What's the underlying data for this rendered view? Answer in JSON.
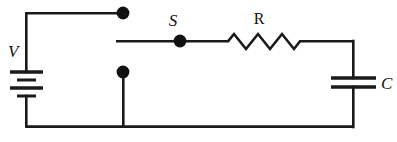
{
  "figure": {
    "background_color": "#ffffff",
    "line_color": "#1a1a1a",
    "width": 397,
    "height": 142
  },
  "components": {
    "battery": {
      "label": "V",
      "label_style": "italic",
      "symbol": "battery-icon",
      "plate_count": 4,
      "x": 25,
      "label_x": 13,
      "label_y": 57
    },
    "switch": {
      "label": "S",
      "label_style": "italic",
      "symbol": "switch-node-icon",
      "state": "open",
      "x": 180,
      "label_x": 173,
      "label_y": 25
    },
    "resistor": {
      "label": "R",
      "label_style": "roman",
      "symbol": "resistor-zigzag-icon",
      "peaks": 3,
      "x_start": 228,
      "x_end": 300,
      "label_x": 257,
      "label_y": 23
    },
    "capacitor": {
      "label": "C",
      "label_style": "italic",
      "symbol": "capacitor-icon",
      "plate_count": 2,
      "x": 353,
      "label_x": 379,
      "label_y": 89
    }
  },
  "nodes": [
    {
      "name": "upper-terminal-dot",
      "x": 123,
      "y": 13,
      "r": 6.2
    },
    {
      "name": "lower-terminal-dot",
      "x": 123,
      "y": 72,
      "r": 6.2
    },
    {
      "name": "switch-contact-dot",
      "x": 180,
      "y": 41,
      "r": 6.2
    }
  ],
  "wires": {
    "top_rail": "M 25,12 L 123,12",
    "left_rail_upper": "M 25,12 L 25,72",
    "left_rail_lower": "M 25,96 L 25,127",
    "bottom_rail": "M 25,127 L 353,127",
    "lower_node_drop": "M 123,72 L 123,127",
    "switch_branch_left": "M 116,41 L 180,41",
    "switch_branch_right": "M 180,41 L 228,41",
    "resistor_to_right": "M 300,41 L 353,41",
    "right_rail_upper": "M 353,41 L 353,78",
    "right_rail_lower": "M 353,87 L 353,127"
  }
}
